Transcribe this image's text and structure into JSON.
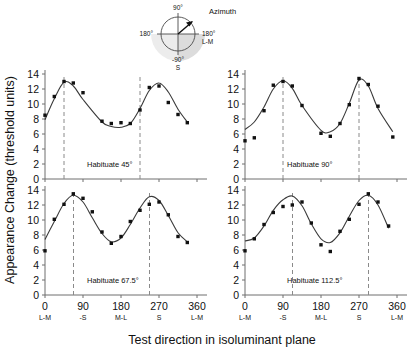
{
  "figure": {
    "y_axis_title": "Appearance Change (threshold units)",
    "x_axis_title": "Test direction in isoluminant plane"
  },
  "compass": {
    "title": "Azimuth",
    "top_label": "90°",
    "left_label": "180°",
    "right_label": "180°",
    "right_sublabel": "L-M",
    "bottom_label": "-90°",
    "bottom_sublabel": "S"
  },
  "axes": {
    "y_ticks": [
      "0",
      "2",
      "4",
      "6",
      "8",
      "10",
      "12",
      "14"
    ],
    "x_ticks": [
      "0",
      "90",
      "180",
      "270",
      "360"
    ],
    "x_subticks": [
      "L-M",
      "-S",
      "M-L",
      "S",
      "L-M"
    ]
  },
  "chart_data": {
    "type": "scatter",
    "title": "",
    "xlabel": "Test direction in isoluminant plane",
    "ylabel": "Appearance Change (threshold units)",
    "xlim": [
      0,
      360
    ],
    "ylim": [
      0,
      14
    ],
    "grid": false,
    "legend": "none",
    "panels": [
      {
        "label": "Habituate 45°",
        "position": "top-left",
        "habituation_azimuth_deg": 45,
        "peak_markers_deg": [
          45,
          225
        ],
        "x": [
          0,
          22,
          45,
          67,
          90,
          135,
          157,
          180,
          202,
          225,
          247,
          270,
          292,
          315,
          337
        ],
        "y": [
          8.5,
          11.0,
          13.0,
          12.8,
          11.5,
          7.7,
          7.4,
          7.5,
          7.4,
          9.2,
          12.2,
          12.4,
          10.2,
          8.6,
          7.5
        ],
        "fit": [
          7.9,
          10.7,
          12.9,
          12.4,
          10.6,
          7.6,
          7.0,
          6.9,
          7.4,
          9.4,
          11.8,
          12.8,
          11.6,
          9.3,
          7.6
        ]
      },
      {
        "label": "Habituate 90°",
        "position": "top-right",
        "habituation_azimuth_deg": 90,
        "peak_markers_deg": [
          90,
          270
        ],
        "x": [
          0,
          22,
          45,
          67,
          90,
          112,
          135,
          180,
          202,
          225,
          247,
          270,
          292,
          315,
          350
        ],
        "y": [
          5.1,
          5.5,
          9.1,
          12.5,
          13.0,
          12.4,
          9.8,
          6.1,
          5.7,
          7.4,
          9.9,
          13.4,
          12.6,
          9.7,
          5.6
        ],
        "fit": [
          6.6,
          7.6,
          9.6,
          12.0,
          13.1,
          12.1,
          9.8,
          6.5,
          6.3,
          7.4,
          10.1,
          13.2,
          12.4,
          9.4,
          6.3
        ]
      },
      {
        "label": "Habituate 67.5°",
        "position": "bottom-left",
        "habituation_azimuth_deg": 67.5,
        "peak_markers_deg": [
          67.5,
          247.5
        ],
        "x": [
          0,
          22,
          45,
          67,
          90,
          112,
          135,
          157,
          180,
          202,
          225,
          247,
          270,
          292,
          315,
          337
        ],
        "y": [
          5.9,
          10.1,
          12.1,
          13.5,
          12.9,
          11.1,
          8.4,
          6.9,
          7.8,
          9.8,
          11.3,
          12.1,
          12.4,
          10.7,
          7.8,
          7.0
        ],
        "fit": [
          7.4,
          9.8,
          12.2,
          13.3,
          12.4,
          10.3,
          8.2,
          7.1,
          7.6,
          9.4,
          11.6,
          13.1,
          12.6,
          10.6,
          8.3,
          7.1
        ]
      },
      {
        "label": "Habituate 112.5°",
        "position": "bottom-right",
        "habituation_azimuth_deg": 112.5,
        "peak_markers_deg": [
          112.5,
          292.5
        ],
        "x": [
          0,
          22,
          45,
          67,
          90,
          112,
          135,
          157,
          180,
          202,
          225,
          247,
          270,
          292,
          315,
          340
        ],
        "y": [
          5.9,
          7.5,
          9.4,
          11.0,
          11.8,
          12.0,
          12.4,
          9.6,
          6.7,
          5.8,
          8.5,
          10.1,
          12.1,
          13.5,
          12.4,
          9.2
        ],
        "fit": [
          7.2,
          7.6,
          9.2,
          11.3,
          12.7,
          13.2,
          11.9,
          9.5,
          7.5,
          7.0,
          8.3,
          10.5,
          12.6,
          13.3,
          12.0,
          8.9
        ]
      }
    ]
  }
}
